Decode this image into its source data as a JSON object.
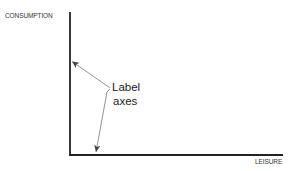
{
  "diagram": {
    "y_axis_label": "CONSUMPTION",
    "x_axis_label": "LEISURE",
    "annotation": {
      "line1": "Label",
      "line2": "axes"
    },
    "colors": {
      "axis": "#222222",
      "arrow": "#666666",
      "text": "#222222"
    }
  }
}
